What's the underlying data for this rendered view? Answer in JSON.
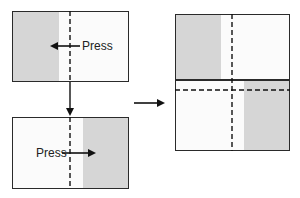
{
  "diagram": {
    "top_left_panel": {
      "label": "Press",
      "arrow_direction": "left",
      "shaded_side": "left"
    },
    "bottom_left_panel": {
      "label": "Press",
      "arrow_direction": "right",
      "shaded_side": "right"
    },
    "result_panel": {
      "description": "Combined: top half shaded left, bottom half shaded right"
    },
    "connectors": [
      {
        "from": "top_left_panel",
        "to": "bottom_left_panel",
        "direction": "down"
      },
      {
        "from": "left_column",
        "to": "result_panel",
        "direction": "right"
      }
    ],
    "colors": {
      "shade": "#d6d6d6",
      "line": "#2a2a2a",
      "background": "#fbfbfb"
    }
  }
}
